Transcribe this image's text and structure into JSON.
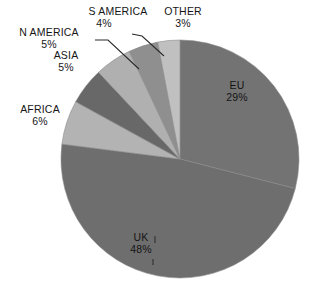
{
  "chart_data": {
    "type": "pie",
    "title": "",
    "subtitle": "",
    "xlabel": "",
    "ylabel": "",
    "legend_position": "none",
    "grid": false,
    "labels_format": "NAME + percent",
    "categories": [
      "EU",
      "UK",
      "AFRICA",
      "N AMERICA",
      "ASIA",
      "S AMERICA",
      "OTHER"
    ],
    "values": [
      29,
      48,
      6,
      5,
      5,
      4,
      3
    ],
    "unit": "%",
    "start_angle_deg": 0,
    "direction": "clockwise",
    "slices": [
      {
        "name": "EU",
        "value": 29,
        "value_label": "29%",
        "color": "#737373",
        "label_placement": "inside"
      },
      {
        "name": "UK",
        "value": 48,
        "value_label": "48%",
        "color": "#6e6e6e",
        "label_placement": "inside"
      },
      {
        "name": "AFRICA",
        "value": 6,
        "value_label": "6%",
        "color": "#b3b3b3",
        "label_placement": "outside"
      },
      {
        "name": "N AMERICA",
        "value": 5,
        "value_label": "5%",
        "color": "#686868",
        "label_placement": "outside"
      },
      {
        "name": "ASIA",
        "value": 5,
        "value_label": "5%",
        "color": "#b0b0b0",
        "label_placement": "outside"
      },
      {
        "name": "S AMERICA",
        "value": 4,
        "value_label": "4%",
        "color": "#8f8f8f",
        "label_placement": "outside"
      },
      {
        "name": "OTHER",
        "value": 3,
        "value_label": "3%",
        "color": "#c0c0c0",
        "label_placement": "outside"
      }
    ],
    "colors": {
      "background": "#ffffff",
      "text": "#161616",
      "leader_line": "#2b2b2b",
      "slice_divider": "#8a8a8a"
    }
  },
  "labels": {
    "eu": {
      "name": "EU",
      "value": "29%"
    },
    "uk": {
      "name": "UK",
      "value": "48%"
    },
    "africa": {
      "name": "AFRICA",
      "value": "6%"
    },
    "n_america": {
      "name": "N AMERICA",
      "value": "5%"
    },
    "asia": {
      "name": "ASIA",
      "value": "5%"
    },
    "s_america": {
      "name": "S AMERICA",
      "value": "4%"
    },
    "other": {
      "name": "OTHER",
      "value": "3%"
    }
  }
}
